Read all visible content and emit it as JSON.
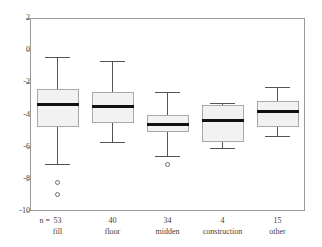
{
  "chart_data": {
    "type": "box",
    "title": "",
    "xlabel": "",
    "ylabel": "",
    "ylim": [
      -10,
      2
    ],
    "y_ticks": [
      2,
      0,
      -2,
      -4,
      -6,
      -8,
      -10
    ],
    "y_tick_labels": [
      "2",
      "0",
      "-2",
      "-4",
      "-6",
      "-8",
      "-10"
    ],
    "grid": false,
    "legend": "none",
    "n_label": "n =",
    "categories": [
      "fill",
      "floor",
      "midden",
      "construction",
      "other"
    ],
    "counts": [
      "53",
      "40",
      "34",
      "4",
      "15"
    ],
    "boxes": [
      {
        "category": "fill",
        "n": "53",
        "whisker_high": -0.45,
        "q3": -2.4,
        "median": -3.4,
        "q1": -4.75,
        "whisker_low": -7.1,
        "outliers": [
          -8.25,
          -9.0
        ]
      },
      {
        "category": "floor",
        "n": "40",
        "whisker_high": -0.7,
        "q3": -2.6,
        "median": -3.5,
        "q1": -4.5,
        "whisker_low": -5.7,
        "outliers": []
      },
      {
        "category": "midden",
        "n": "34",
        "whisker_high": -2.6,
        "q3": -4.05,
        "median": -4.65,
        "q1": -5.1,
        "whisker_low": -6.55,
        "outliers": [
          -7.1
        ]
      },
      {
        "category": "construction",
        "n": "4",
        "whisker_high": -3.3,
        "q3": -3.4,
        "median": -4.4,
        "q1": -5.7,
        "whisker_low": -6.1,
        "outliers": []
      },
      {
        "category": "other",
        "n": "15",
        "whisker_high": -2.3,
        "q3": -3.15,
        "median": -3.8,
        "q1": -4.75,
        "whisker_low": -5.35,
        "outliers": []
      }
    ]
  },
  "colors": {
    "box_fill": "#f2f2f2",
    "box_border": "#a8a8a8",
    "median": "#111111",
    "whisker": "#555555",
    "frame": "#9a9a9a",
    "text": "#3d3d3d",
    "background": "#ffffff"
  }
}
